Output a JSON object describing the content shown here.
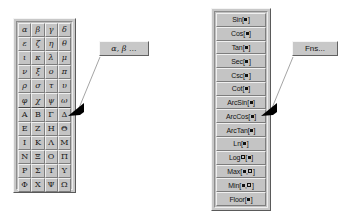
{
  "greek_palette": {
    "name": "Greek letter palette",
    "lowercase_rows": [
      [
        "α",
        "β",
        "γ",
        "δ"
      ],
      [
        "ε",
        "ζ",
        "η",
        "θ"
      ],
      [
        "ι",
        "κ",
        "λ",
        "μ"
      ],
      [
        "ν",
        "ξ",
        "ο",
        "π"
      ],
      [
        "ρ",
        "σ",
        "τ",
        "υ"
      ],
      [
        "φ",
        "χ",
        "ψ",
        "ω"
      ]
    ],
    "uppercase_rows": [
      [
        "Α",
        "Β",
        "Γ",
        "Δ"
      ],
      [
        "Ε",
        "Ζ",
        "Η",
        "Θ"
      ],
      [
        "Ι",
        "Κ",
        "Λ",
        "Μ"
      ],
      [
        "Ν",
        "Ξ",
        "Ο",
        "Π"
      ],
      [
        "Ρ",
        "Σ",
        "Τ",
        "Υ"
      ],
      [
        "Φ",
        "Χ",
        "Ψ",
        "Ω"
      ]
    ]
  },
  "fns_palette": {
    "name": "Functions palette",
    "items": [
      {
        "label": "Sin",
        "args": [
          "filled"
        ]
      },
      {
        "label": "Cos",
        "args": [
          "filled"
        ]
      },
      {
        "label": "Tan",
        "args": [
          "filled"
        ]
      },
      {
        "label": "Sec",
        "args": [
          "filled"
        ]
      },
      {
        "label": "Csc",
        "args": [
          "filled"
        ]
      },
      {
        "label": "Cot",
        "args": [
          "filled"
        ]
      },
      {
        "label": "ArcSin",
        "args": [
          "filled"
        ]
      },
      {
        "label": "ArcCos",
        "args": [
          "filled"
        ]
      },
      {
        "label": "ArcTan",
        "args": [
          "filled"
        ]
      },
      {
        "label": "Ln",
        "args": [
          "filled"
        ]
      },
      {
        "label": "Log",
        "subscript": "open",
        "args": [
          "filled"
        ]
      },
      {
        "label": "Max",
        "args": [
          "filled",
          "open"
        ]
      },
      {
        "label": "Min",
        "args": [
          "filled",
          "open"
        ]
      },
      {
        "label": "Floor",
        "args": [
          "filled"
        ]
      }
    ]
  },
  "callouts": {
    "greek_label": "α, β ...",
    "fns_label": "Fns..."
  },
  "colors": {
    "face": "#c0c0c0",
    "button_face": "#c4c4c4",
    "highlight": "#f0f0f0",
    "shadow": "#7d7d7d",
    "text": "#111111",
    "arrow": "#000000",
    "leader_line": "#9a9a9a",
    "background": "#ffffff"
  }
}
